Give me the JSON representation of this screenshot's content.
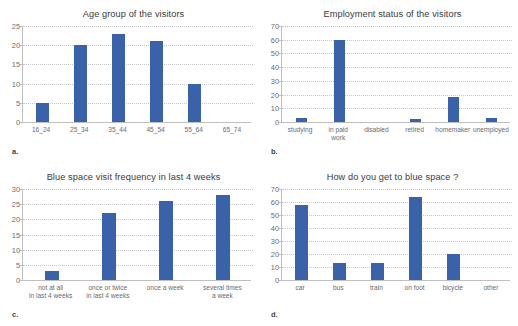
{
  "figure": {
    "background_color": "#ffffff",
    "bar_color": "#3a62aa",
    "gridline_color": "#c6c6c6",
    "axis_color": "#bfbfbf",
    "text_color": "#6b6b6b",
    "panel_labels": {
      "a": "a.",
      "b": "b.",
      "c": "c.",
      "d": "d."
    }
  },
  "chart_data": [
    {
      "type": "bar",
      "panel": "a",
      "title": "Age group of the visitors",
      "categories": [
        "16_24",
        "25_34",
        "35_44",
        "45_54",
        "55_64",
        "65_74"
      ],
      "values": [
        5,
        20,
        23,
        21,
        10,
        0
      ],
      "xlabel": "",
      "ylabel": "",
      "ylim": [
        0,
        25
      ],
      "yticks": [
        0,
        5,
        10,
        15,
        20,
        25
      ],
      "grid": true,
      "legend": "none",
      "bar_color": "#3a62aa"
    },
    {
      "type": "bar",
      "panel": "b",
      "title": "Employment status of the visitors",
      "categories": [
        "studying",
        "in paid\nwork",
        "disabled",
        "retired",
        "homemaker",
        "unemployed"
      ],
      "values": [
        3,
        60,
        0,
        2,
        18,
        3
      ],
      "xlabel": "",
      "ylabel": "",
      "ylim": [
        0,
        70
      ],
      "yticks": [
        0,
        10,
        20,
        30,
        40,
        50,
        60,
        70
      ],
      "grid": true,
      "legend": "none",
      "bar_color": "#3a62aa"
    },
    {
      "type": "bar",
      "panel": "c",
      "title": "Blue space visit frequency in last 4 weeks",
      "categories": [
        "not at all\nin last 4 weeks",
        "once or twice\nin last 4 weeks",
        "once a week",
        "several times\na week"
      ],
      "values": [
        3,
        22,
        26,
        28
      ],
      "xlabel": "",
      "ylabel": "",
      "ylim": [
        0,
        30
      ],
      "yticks": [
        0,
        5,
        10,
        15,
        20,
        25,
        30
      ],
      "grid": true,
      "legend": "none",
      "bar_color": "#3a62aa"
    },
    {
      "type": "bar",
      "panel": "d",
      "title": "How do you get to blue space ?",
      "categories": [
        "car",
        "bus",
        "train",
        "on foot",
        "bicycle",
        "other"
      ],
      "values": [
        58,
        13,
        13,
        64,
        20,
        0
      ],
      "xlabel": "",
      "ylabel": "",
      "ylim": [
        0,
        70
      ],
      "yticks": [
        0,
        10,
        20,
        30,
        40,
        50,
        60,
        70
      ],
      "grid": true,
      "legend": "none",
      "bar_color": "#3a62aa"
    }
  ]
}
